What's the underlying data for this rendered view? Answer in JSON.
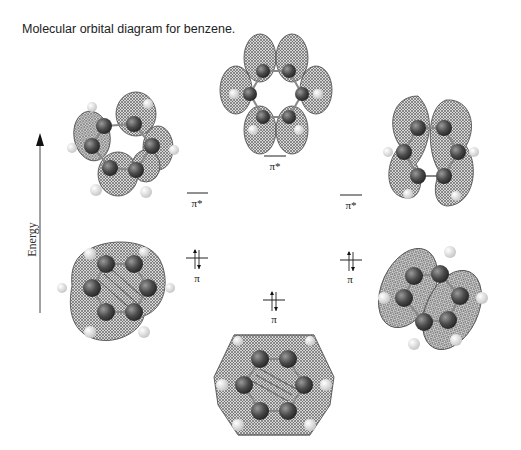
{
  "caption": "Molecular orbital diagram for benzene.",
  "axis": {
    "label": "Energy",
    "direction": "up"
  },
  "levels": [
    {
      "id": "pi-star-top",
      "label": "π*",
      "occupied": false,
      "x": 275,
      "y": 156
    },
    {
      "id": "pi-star-left",
      "label": "π*",
      "occupied": false,
      "x": 197,
      "y": 193
    },
    {
      "id": "pi-star-right",
      "label": "π*",
      "occupied": false,
      "x": 351,
      "y": 195
    },
    {
      "id": "pi-left",
      "label": "π",
      "occupied": true,
      "electrons": 2,
      "x": 197,
      "y": 258
    },
    {
      "id": "pi-right",
      "label": "π",
      "occupied": true,
      "electrons": 2,
      "x": 350,
      "y": 260
    },
    {
      "id": "pi-bottom",
      "label": "π",
      "occupied": true,
      "electrons": 2,
      "x": 275,
      "y": 300
    }
  ],
  "orbitals": [
    {
      "name": "antibonding-top",
      "position": "top-center"
    },
    {
      "name": "antibonding-left",
      "position": "upper-left"
    },
    {
      "name": "antibonding-right",
      "position": "upper-right"
    },
    {
      "name": "bonding-left",
      "position": "lower-left"
    },
    {
      "name": "bonding-right",
      "position": "lower-right"
    },
    {
      "name": "bonding-bottom",
      "position": "bottom-center"
    }
  ],
  "colors": {
    "mesh": "#6a6a6a",
    "carbon": "#4a4a4a",
    "hydrogen": "#e8e8e8",
    "text": "#222222"
  }
}
